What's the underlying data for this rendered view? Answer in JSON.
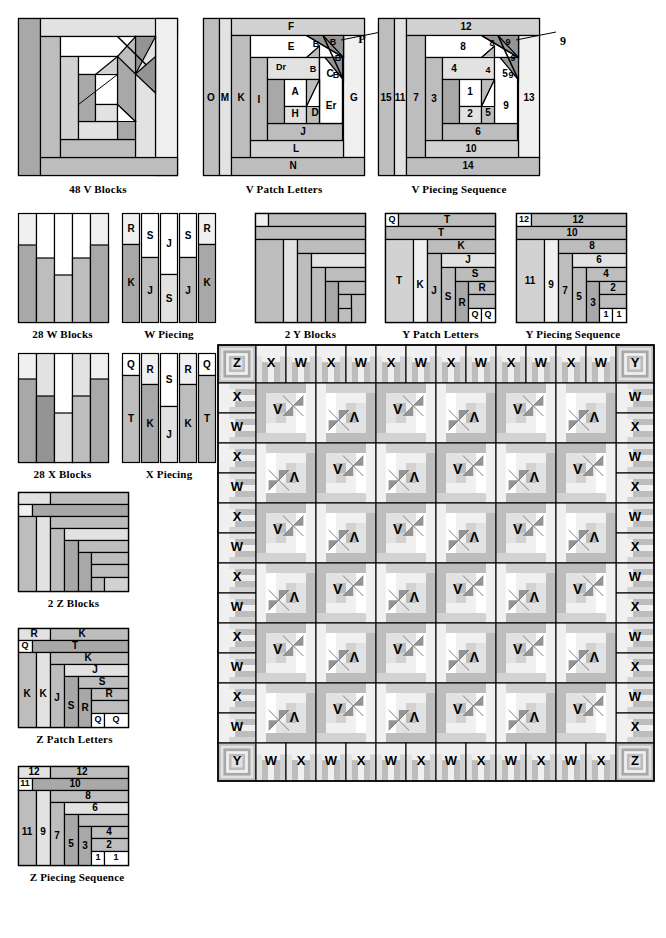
{
  "document": {
    "title": "Quilt Block Piecing Diagrams",
    "type": "quilting-pattern-instruction-sheet"
  },
  "palette": {
    "white": "#ffffff",
    "very_light": "#f0f0f0",
    "light": "#e2e2e2",
    "light_mid": "#d2d2d2",
    "mid": "#bdbdbd",
    "mid_dark": "#a8a8a8",
    "dark": "#949494",
    "darker": "#808080",
    "outline": "#000000"
  },
  "figures": [
    {
      "id": "v-blocks",
      "caption": "48 V Blocks",
      "kind": "log-cabin-pinwheel-block"
    },
    {
      "id": "v-patch-letters",
      "caption": "V Patch Letters",
      "kind": "log-cabin-pinwheel-block",
      "labels": [
        "F",
        "E",
        "B",
        "B",
        "B",
        "B",
        "P",
        "Dr",
        "C",
        "G",
        "O",
        "M",
        "K",
        "I",
        "A",
        "D",
        "Er",
        "H",
        "J",
        "L",
        "N"
      ],
      "callout": "P"
    },
    {
      "id": "v-piecing-sequence",
      "caption": "V Piecing Sequence",
      "kind": "log-cabin-pinwheel-block",
      "labels": [
        "12",
        "8",
        "8",
        "9",
        "9",
        "9",
        "4",
        "4",
        "5",
        "13",
        "15",
        "11",
        "7",
        "3",
        "1",
        "5",
        "9",
        "2",
        "6",
        "10",
        "14"
      ],
      "callout": "9"
    },
    {
      "id": "w-blocks",
      "caption": "28 W Blocks",
      "kind": "strip-block"
    },
    {
      "id": "w-piecing",
      "caption": "W Piecing",
      "kind": "strip-piecing",
      "strips": [
        [
          "R",
          "K"
        ],
        [
          "S",
          "J"
        ],
        [
          "J",
          "S"
        ],
        [
          "S",
          "J"
        ],
        [
          "R",
          "K"
        ]
      ]
    },
    {
      "id": "y-blocks",
      "caption": "2 Y Blocks",
      "kind": "log-cabin-block"
    },
    {
      "id": "y-patch-letters",
      "caption": "Y Patch Letters",
      "kind": "log-cabin-block",
      "labels": [
        "Q",
        "T",
        "T",
        "T",
        "K",
        "K",
        "J",
        "J",
        "S",
        "S",
        "R",
        "R",
        "Q",
        "Q"
      ]
    },
    {
      "id": "y-piecing-sequence",
      "caption": "Y Piecing Sequence",
      "kind": "log-cabin-block",
      "labels": [
        "12",
        "12",
        "10",
        "11",
        "8",
        "9",
        "6",
        "7",
        "5",
        "4",
        "3",
        "2",
        "1",
        "1"
      ]
    },
    {
      "id": "x-blocks",
      "caption": "28 X Blocks",
      "kind": "strip-block"
    },
    {
      "id": "x-piecing",
      "caption": "X Piecing",
      "kind": "strip-piecing",
      "strips": [
        [
          "Q",
          "T"
        ],
        [
          "R",
          "K"
        ],
        [
          "S",
          "J"
        ],
        [
          "R",
          "K"
        ],
        [
          "Q",
          "T"
        ]
      ]
    },
    {
      "id": "z-blocks",
      "caption": "2 Z Blocks",
      "kind": "log-cabin-block"
    },
    {
      "id": "z-patch-letters",
      "caption": "Z Patch Letters",
      "kind": "log-cabin-block",
      "labels": [
        "R",
        "K",
        "Q",
        "T",
        "K",
        "J",
        "K",
        "K",
        "J",
        "S",
        "S",
        "R",
        "R",
        "Q",
        "Q"
      ]
    },
    {
      "id": "z-piecing-sequence",
      "caption": "Z Piecing Sequence",
      "kind": "log-cabin-block",
      "labels": [
        "12",
        "12",
        "11",
        "10",
        "8",
        "6",
        "11",
        "9",
        "7",
        "5",
        "4",
        "3",
        "2",
        "1",
        "1"
      ]
    },
    {
      "id": "quilt-layout",
      "caption": "",
      "kind": "quilt-assembly-grid"
    }
  ],
  "quilt_layout": {
    "top_row": [
      "Z",
      "X",
      "W",
      "X",
      "W",
      "X",
      "W",
      "X",
      "W",
      "X",
      "W",
      "X",
      "W",
      "Y"
    ],
    "bottom_row": [
      "Y",
      "W",
      "X",
      "W",
      "X",
      "W",
      "X",
      "W",
      "X",
      "W",
      "X",
      "W",
      "X",
      "Z"
    ],
    "left_column": [
      "X",
      "W",
      "X",
      "W",
      "X",
      "W",
      "X",
      "W",
      "X",
      "W",
      "X",
      "W"
    ],
    "right_column": [
      "W",
      "X",
      "W",
      "X",
      "W",
      "X",
      "W",
      "X",
      "W",
      "X",
      "W",
      "X"
    ],
    "interior_label": "V",
    "interior_rows": 6,
    "interior_cols": 6
  }
}
